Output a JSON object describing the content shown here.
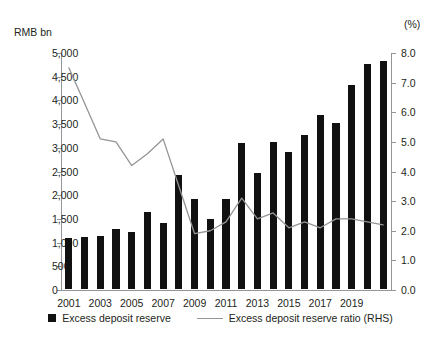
{
  "chart_data": {
    "type": "bar",
    "title": "",
    "xlabel": "",
    "ylabel": "RMB bn",
    "y2label": "(%)",
    "grid": false,
    "legend_position": "bottom-center",
    "categories": [
      "2001",
      "2002",
      "2003",
      "2004",
      "2005",
      "2006",
      "2007",
      "2008",
      "2009",
      "2010",
      "2011",
      "2012",
      "2013",
      "2014",
      "2015",
      "2016",
      "2017",
      "2018",
      "2019",
      "2020",
      "2021"
    ],
    "x_tick_labels": [
      "2001",
      "2003",
      "2005",
      "2007",
      "2009",
      "2011",
      "2013",
      "2015",
      "2017",
      "2019"
    ],
    "ylim": [
      0,
      5000
    ],
    "y_ticks": [
      0,
      500,
      1000,
      1500,
      2000,
      2500,
      3000,
      3500,
      4000,
      4500,
      5000
    ],
    "y_tick_labels": [
      "0",
      "500",
      "1,000",
      "1,500",
      "2,000",
      "2,500",
      "3,000",
      "3,500",
      "4,000",
      "4,500",
      "5,000"
    ],
    "y2lim": [
      0,
      8
    ],
    "y2_ticks": [
      0,
      1,
      2,
      3,
      4,
      5,
      6,
      7,
      8
    ],
    "y2_tick_labels": [
      "0.0",
      "1.0",
      "2.0",
      "3.0",
      "4.0",
      "5.0",
      "6.0",
      "7.0",
      "8.0"
    ],
    "series": [
      {
        "name": "Excess deposit reserve",
        "type": "bar",
        "axis": "left",
        "unit": "RMB bn",
        "color": "#111111",
        "values": [
          1080,
          1100,
          1120,
          1270,
          1210,
          1630,
          1400,
          2400,
          1900,
          1470,
          1900,
          3080,
          2450,
          3100,
          2900,
          3250,
          3670,
          3500,
          4310,
          4750,
          4800
        ]
      },
      {
        "name": "Excess deposit reserve ratio (RHS)",
        "type": "line",
        "axis": "right",
        "unit": "%",
        "color": "#939598",
        "values": [
          7.5,
          6.3,
          5.1,
          5.0,
          4.2,
          4.6,
          5.1,
          3.5,
          1.9,
          2.0,
          2.3,
          3.1,
          2.4,
          2.6,
          2.1,
          2.3,
          2.1,
          2.4,
          2.4,
          2.3,
          2.2
        ]
      }
    ]
  },
  "legend": {
    "items": [
      {
        "label": "Excess deposit reserve",
        "marker": "square-swatch"
      },
      {
        "label": "Excess deposit reserve ratio (RHS)",
        "marker": "line-swatch"
      }
    ]
  }
}
